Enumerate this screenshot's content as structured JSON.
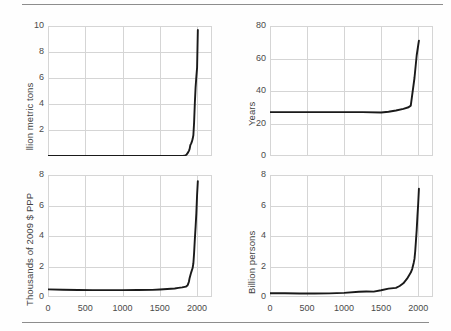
{
  "figure": {
    "background": "#fefefe",
    "line_color": "#1a1a1a",
    "grid_color": "#d5d5d5",
    "rule_color": "#8d8d8d",
    "text_color": "#3a3a3a"
  },
  "rules": {
    "top_label": "top-divider-rule",
    "bottom_label": "bottom-divider-rule"
  },
  "xaxis": {
    "ticks": [
      "0",
      "500",
      "1000",
      "1500",
      "2000"
    ],
    "min": 0,
    "max": 2200
  },
  "chart_data": [
    {
      "id": "co2",
      "type": "line",
      "title": "CO2 emissions",
      "title_main": "CO",
      "title_sub": "2",
      "title_rest": " emissions",
      "xlabel": "",
      "ylabel": "Billion metric tons",
      "xlim": [
        0,
        2200
      ],
      "ylim": [
        0,
        10
      ],
      "yticks": [
        "10",
        "8",
        "6",
        "4",
        "2",
        "0"
      ],
      "ytick_values": [
        10,
        8,
        6,
        4,
        2,
        0
      ],
      "xticks": [
        "0",
        "500",
        "1000",
        "1500",
        "2000"
      ],
      "xtick_values": [
        0,
        500,
        1000,
        1500,
        2000
      ],
      "grid": true,
      "x": [
        0,
        200,
        400,
        600,
        800,
        1000,
        1200,
        1400,
        1500,
        1600,
        1700,
        1750,
        1800,
        1820,
        1840,
        1850,
        1860,
        1870,
        1880,
        1890,
        1900,
        1910,
        1920,
        1930,
        1940,
        1950,
        1960,
        1970,
        1980,
        1990,
        2000,
        2010
      ],
      "y": [
        0.003,
        0.003,
        0.003,
        0.004,
        0.004,
        0.005,
        0.005,
        0.006,
        0.006,
        0.007,
        0.008,
        0.009,
        0.01,
        0.02,
        0.05,
        0.07,
        0.12,
        0.2,
        0.28,
        0.4,
        0.55,
        0.85,
        0.95,
        1.1,
        1.3,
        1.6,
        2.6,
        4.1,
        5.3,
        6.1,
        6.8,
        9.7
      ]
    },
    {
      "id": "life",
      "type": "line",
      "title": "Life expectancy",
      "title_main": "Life expectancy",
      "title_sub": "",
      "title_rest": "",
      "xlabel": "",
      "ylabel": "Years",
      "xlim": [
        0,
        2200
      ],
      "ylim": [
        0,
        80
      ],
      "yticks": [
        "80",
        "60",
        "40",
        "20",
        "0"
      ],
      "ytick_values": [
        80,
        60,
        40,
        20,
        0
      ],
      "xticks": [
        "0",
        "500",
        "1000",
        "1500",
        "2000"
      ],
      "xtick_values": [
        0,
        500,
        1000,
        1500,
        2000
      ],
      "grid": true,
      "x": [
        0,
        250,
        500,
        750,
        1000,
        1250,
        1500,
        1600,
        1700,
        1800,
        1870,
        1900,
        1950,
        1980,
        2000,
        2010
      ],
      "y": [
        27,
        27,
        27,
        27,
        27,
        27,
        26.8,
        27.2,
        28,
        29,
        30,
        31,
        48,
        62,
        68,
        71
      ]
    },
    {
      "id": "gdp",
      "type": "line",
      "title": "GDP per person",
      "title_main": "GDP per person",
      "title_sub": "",
      "title_rest": "",
      "xlabel": "",
      "ylabel": "Thousands of 2009 $ PPP",
      "xlim": [
        0,
        2200
      ],
      "ylim": [
        0,
        8
      ],
      "yticks": [
        "8",
        "6",
        "4",
        "2",
        "0"
      ],
      "ytick_values": [
        8,
        6,
        4,
        2,
        0
      ],
      "xticks": [
        "0",
        "500",
        "1000",
        "1500",
        "2000"
      ],
      "xtick_values": [
        0,
        500,
        1000,
        1500,
        2000
      ],
      "grid": true,
      "x": [
        0,
        200,
        400,
        600,
        800,
        1000,
        1200,
        1400,
        1500,
        1600,
        1700,
        1750,
        1800,
        1850,
        1870,
        1880,
        1890,
        1900,
        1920,
        1940,
        1950,
        1960,
        1970,
        1980,
        1990,
        2000,
        2010
      ],
      "y": [
        0.5,
        0.48,
        0.46,
        0.45,
        0.45,
        0.45,
        0.46,
        0.47,
        0.49,
        0.52,
        0.56,
        0.6,
        0.63,
        0.68,
        0.75,
        0.85,
        1.0,
        1.25,
        1.6,
        1.9,
        2.2,
        2.9,
        3.8,
        4.6,
        5.5,
        6.7,
        7.6
      ]
    },
    {
      "id": "population",
      "type": "line",
      "title": "Population",
      "title_main": "Population",
      "title_sub": "",
      "title_rest": "",
      "xlabel": "",
      "ylabel": "Billion persons",
      "xlim": [
        0,
        2200
      ],
      "ylim": [
        0,
        8
      ],
      "yticks": [
        "8",
        "6",
        "4",
        "2",
        "0"
      ],
      "ytick_values": [
        8,
        6,
        4,
        2,
        0
      ],
      "xticks": [
        "0",
        "500",
        "1000",
        "1500",
        "2000"
      ],
      "xtick_values": [
        0,
        500,
        1000,
        1500,
        2000
      ],
      "grid": true,
      "x": [
        0,
        200,
        400,
        600,
        800,
        1000,
        1200,
        1300,
        1400,
        1500,
        1600,
        1700,
        1750,
        1800,
        1850,
        1900,
        1920,
        1940,
        1950,
        1960,
        1970,
        1980,
        1990,
        2000,
        2010
      ],
      "y": [
        0.25,
        0.25,
        0.23,
        0.23,
        0.24,
        0.27,
        0.34,
        0.36,
        0.35,
        0.44,
        0.55,
        0.6,
        0.72,
        0.9,
        1.2,
        1.6,
        1.85,
        2.25,
        2.5,
        3.0,
        3.7,
        4.4,
        5.3,
        6.1,
        7.1
      ]
    }
  ]
}
